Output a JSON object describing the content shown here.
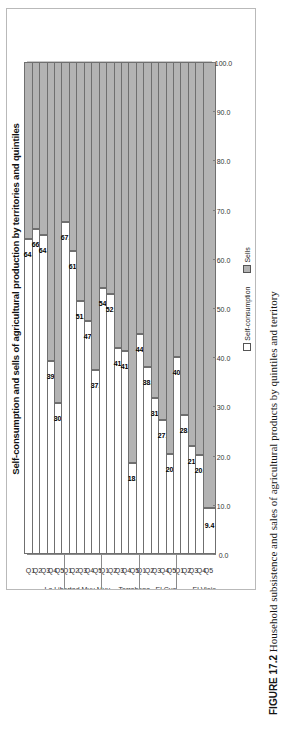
{
  "figure": {
    "label": "FIGURE 17.2",
    "caption_text": "Household subsistence and sales of agricultural products by quintiles and territory"
  },
  "chart_data": {
    "type": "bar",
    "orientation": "stacked-horizontal-rotated",
    "title": "Self-consumption and sells of agricultural production by territories and quintiles",
    "xlabel": "",
    "ylabel": "",
    "ylim": [
      0,
      100
    ],
    "grid": true,
    "legend_position": "bottom",
    "value_ticks": [
      "100.0",
      "90.0",
      "80.0",
      "70.0",
      "60.0",
      "50.0",
      "40.0",
      "30.0",
      "20.0",
      "10.0",
      "0.0"
    ],
    "legend": [
      {
        "name": "Self-consumption",
        "color": "#ffffff"
      },
      {
        "name": "Sells",
        "color": "#b3b3b3"
      }
    ],
    "series": [
      {
        "name": "Self-consumption",
        "color": "#ffffff"
      },
      {
        "name": "Sells",
        "color": "#b3b3b3"
      }
    ],
    "groups": [
      {
        "territory": "La Libertad",
        "categories": [
          "Q1",
          "Q2",
          "Q3",
          "Q4",
          "Q5"
        ],
        "self_consumption": [
          64.1,
          66.1,
          64.9,
          39.2,
          30.6
        ],
        "sells": [
          35.9,
          33.9,
          35.1,
          60.8,
          69.4
        ]
      },
      {
        "territory": "Muy Muy",
        "categories": [
          "Q1",
          "Q2",
          "Q3",
          "Q4",
          "Q5"
        ],
        "self_consumption": [
          67.4,
          61.6,
          51.4,
          47.4,
          37.4
        ],
        "sells": [
          32.6,
          38.4,
          48.6,
          52.6,
          62.6
        ]
      },
      {
        "territory": "Terrabona",
        "categories": [
          "Q1",
          "Q2",
          "Q3",
          "Q4",
          "Q5"
        ],
        "self_consumption": [
          54.0,
          52.9,
          41.8,
          41.3,
          18.5
        ],
        "sells": [
          46.0,
          47.1,
          58.2,
          58.7,
          81.5
        ]
      },
      {
        "territory": "El Cua",
        "categories": [
          "Q1",
          "Q2",
          "Q3",
          "Q4",
          "Q5"
        ],
        "self_consumption": [
          44.8,
          38.0,
          31.7,
          27.2,
          20.3
        ],
        "sells": [
          55.2,
          62.0,
          68.3,
          72.8,
          79.7
        ]
      },
      {
        "territory": "El Viejo",
        "categories": [
          "Q1",
          "Q2",
          "Q3",
          "Q4",
          "Q5"
        ],
        "self_consumption": [
          40.0,
          28.2,
          21.9,
          20.2,
          9.4
        ],
        "sells": [
          60.0,
          71.8,
          78.1,
          79.8,
          90.6
        ]
      }
    ]
  }
}
